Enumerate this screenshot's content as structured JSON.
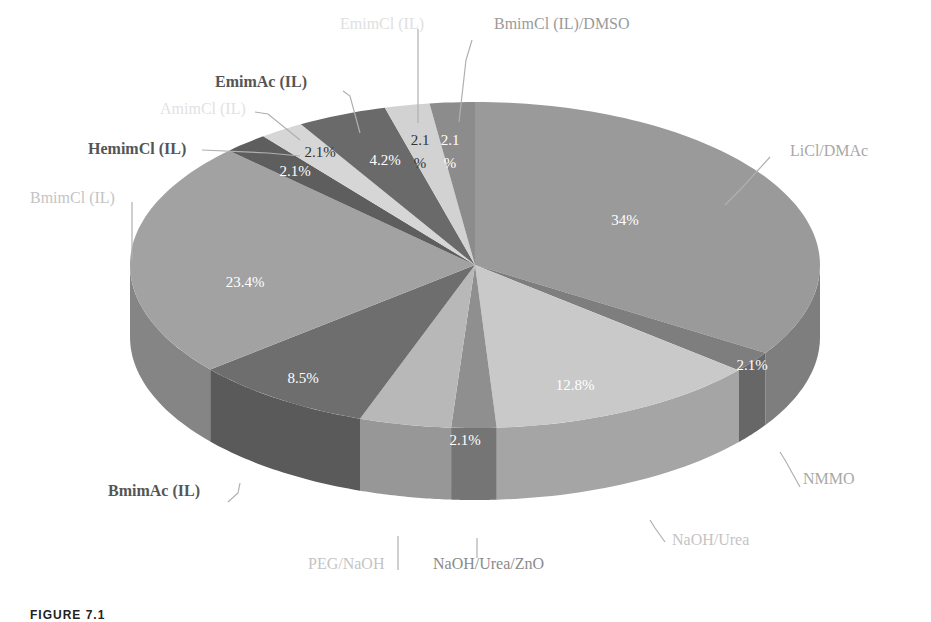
{
  "chart_data": {
    "type": "pie",
    "style": "3d",
    "title": "",
    "categories": [
      "LiCl/DMAc",
      "NMMO",
      "NaOH/Urea",
      "NaOH/Urea/ZnO",
      "PEG/NaOH",
      "BmimAc (IL)",
      "BmimCl (IL)",
      "HemimCl (IL)",
      "AmimCl (IL)",
      "EmimAc (IL)",
      "EmimCl (IL)",
      "BmimCl (IL)/DMSO"
    ],
    "values": [
      34,
      2.1,
      12.8,
      2.1,
      4.3,
      8.5,
      23.4,
      2.1,
      2.1,
      4.2,
      2.1,
      2.1
    ],
    "data_labels": [
      "34%",
      "2.1%",
      "12.8%",
      "2.1%",
      "",
      "8.5%",
      "23.4%",
      "2.1%",
      "2.1%",
      "4.2%",
      "2.1%",
      "2.1%"
    ],
    "colors": [
      "#9a9a9a",
      "#7e7e7e",
      "#c9c9c9",
      "#8f8f8f",
      "#b8b8b8",
      "#6e6e6e",
      "#a2a2a2",
      "#5e5e5e",
      "#d6d6d6",
      "#6a6a6a",
      "#d2d2d2",
      "#8c8c8c"
    ],
    "legend": "none (leader-line labels)"
  },
  "labels": {
    "licl": "LiCl/DMAc",
    "nmmo": "NMMO",
    "naoh_urea": "NaOH/Urea",
    "naoh_urea_zno": "NaOH/Urea/ZnO",
    "peg": "PEG/NaOH",
    "bmimac": "BmimAc  (IL)",
    "bmimcl": "BmimCl  (IL)",
    "hemimcl": "HemimCl  (IL)",
    "amimcl": "AmimCl  (IL)",
    "emimac": "EmimAc  (IL)",
    "emimcl": "EmimCl  (IL)",
    "bmimcl_dmso": "BmimCl  (IL)/DMSO"
  },
  "pcts": {
    "licl": "34%",
    "nmmo": "2.1%",
    "naoh_urea": "12.8%",
    "naoh_urea_zno": "2.1%",
    "bmimac": "8.5%",
    "bmimcl": "23.4%",
    "hemimcl": "2.1%",
    "amimcl": "2.1%",
    "emimac": "4.2%",
    "emimcl_a": "2.1",
    "emimcl_b": "%",
    "dmso_a": "2.1",
    "dmso_b": "%"
  },
  "caption": "FIGURE 7.1"
}
